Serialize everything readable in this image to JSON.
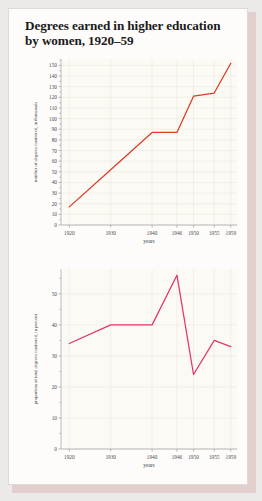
{
  "page": {
    "title_line1": "Degrees earned in higher education",
    "title_line2": "by women, 1920–59",
    "background_color": "#eceae8",
    "paper_color": "#fdfcfa",
    "shadow_color": "#e3cfcd"
  },
  "chart_data": [
    {
      "type": "line",
      "id": "degrees-conferred-thousands",
      "title": "",
      "xlabel": "years",
      "ylabel": "number of degrees conferred, in thousands",
      "x": [
        1920,
        1930,
        1940,
        1946,
        1950,
        1955,
        1959
      ],
      "xtick_labels": [
        "1920",
        "1930",
        "1940",
        "1946",
        "1950",
        "1955",
        "1959"
      ],
      "values": [
        17,
        52,
        87,
        87,
        121,
        124,
        152
      ],
      "ytick_labels": [
        "0",
        "10",
        "20",
        "30",
        "40",
        "50",
        "60",
        "70",
        "80",
        "90",
        "100",
        "110",
        "120",
        "130",
        "140",
        "150"
      ],
      "ylim": [
        0,
        156
      ],
      "xlim": [
        1918,
        1960.5
      ],
      "grid": true,
      "legend": "none",
      "line_color": "#e03b28",
      "plot_background": "#fbfaf4"
    },
    {
      "type": "line",
      "id": "proportion-of-total-degrees-percent",
      "title": "",
      "xlabel": "years",
      "ylabel": "proportion of total degrees conferred, in percent",
      "x": [
        1920,
        1930,
        1940,
        1946,
        1950,
        1955,
        1959
      ],
      "xtick_labels": [
        "1920",
        "1930",
        "1940",
        "1946",
        "1950",
        "1955",
        "1959"
      ],
      "values": [
        34,
        40,
        40,
        56,
        24,
        35,
        33
      ],
      "ytick_labels": [
        "0",
        "10",
        "20",
        "30",
        "40",
        "50"
      ],
      "ylim": [
        0,
        58
      ],
      "xlim": [
        1918,
        1960.5
      ],
      "grid": true,
      "legend": "none",
      "line_color": "#e5356b",
      "plot_background": "#fbfaf4"
    }
  ]
}
